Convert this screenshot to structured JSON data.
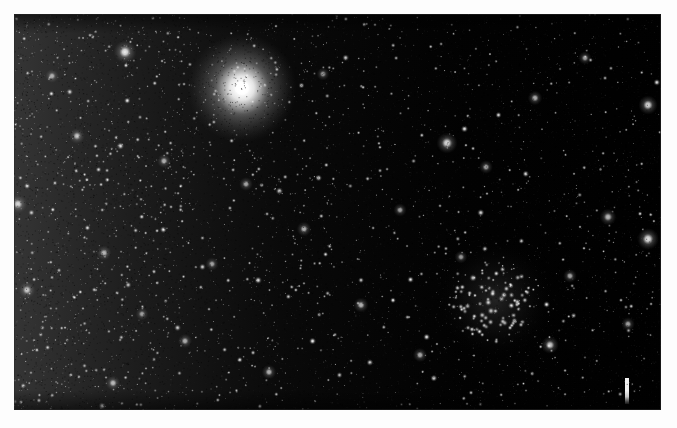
{
  "image": {
    "kind": "astronomical-photograph",
    "medium": "black-and-white photographic plate",
    "subject": "dense Milky Way star field containing a bright foreground star and an open star cluster",
    "alt_text": "Black and white astrophotograph of a dense star field; a very bright star lies in the upper left-of-center, a compact open star cluster lies in the lower right, and a short white vertical index mark is printed near the bottom right corner.",
    "width": 677,
    "height": 428,
    "border": {
      "color": "#fdfdfd",
      "left": 14,
      "top": 14,
      "right": 16,
      "bottom": 18
    },
    "plate": {
      "x": 14,
      "y": 14,
      "width": 647,
      "height": 396,
      "background_color": "#000000",
      "edge_color": "#282828"
    }
  },
  "chart_data": {
    "type": "scatter",
    "xlabel": "",
    "ylabel": "",
    "xlim": [
      0,
      647
    ],
    "ylim": [
      0,
      396
    ],
    "grid": false,
    "legend": "none",
    "background": "#000000",
    "point_color": "#ffffff",
    "density_regions": [
      {
        "name": "left-star-cloud",
        "x": 0,
        "y": 0,
        "width": 170,
        "height": 396,
        "relative_density": 1.0,
        "description": "richest Milky Way star cloud, left edge"
      },
      {
        "name": "left-center-field",
        "x": 170,
        "y": 0,
        "width": 150,
        "height": 396,
        "relative_density": 0.72,
        "description": "moderately rich field"
      },
      {
        "name": "center-field",
        "x": 320,
        "y": 0,
        "width": 160,
        "height": 396,
        "relative_density": 0.46,
        "description": "sparser mid field"
      },
      {
        "name": "right-field",
        "x": 480,
        "y": 0,
        "width": 167,
        "height": 396,
        "relative_density": 0.4,
        "description": "sparsest field, discrete stars"
      }
    ],
    "faint_star_count": 5200,
    "named_features": [
      {
        "name": "bright-foreground-star",
        "label": "Bright foreground star",
        "x": 228,
        "y": 74,
        "brightness": 1.0,
        "radius": 26,
        "core_radius": 7,
        "description": "dominant overexposed star with broad diffuse halo, upper left-of-center"
      },
      {
        "name": "open-star-cluster",
        "label": "Open star cluster",
        "x": 481,
        "y": 286,
        "brightness": 0.85,
        "radius": 48,
        "member_count": 95,
        "description": "compact concentration of resolved cluster members, lower right"
      },
      {
        "name": "index-tick-mark",
        "label": "Index tick mark",
        "x": 611,
        "y": 364,
        "width": 4,
        "height": 26,
        "color": "#f2f2f2",
        "description": "short white vertical fiducial mark printed near the bottom right corner"
      }
    ],
    "bright_stars": [
      {
        "x": 111,
        "y": 38,
        "brightness": 0.92,
        "radius": 5.5
      },
      {
        "x": 228,
        "y": 74,
        "brightness": 1.0,
        "radius": 26.0
      },
      {
        "x": 433,
        "y": 129,
        "brightness": 0.88,
        "radius": 5.0
      },
      {
        "x": 634,
        "y": 91,
        "brightness": 0.86,
        "radius": 4.6
      },
      {
        "x": 634,
        "y": 225,
        "brightness": 0.9,
        "radius": 5.2
      },
      {
        "x": 594,
        "y": 203,
        "brightness": 0.74,
        "radius": 4.0
      },
      {
        "x": 536,
        "y": 331,
        "brightness": 0.8,
        "radius": 4.2
      },
      {
        "x": 4,
        "y": 190,
        "brightness": 0.82,
        "radius": 4.4
      },
      {
        "x": 13,
        "y": 276,
        "brightness": 0.78,
        "radius": 4.0
      },
      {
        "x": 90,
        "y": 239,
        "brightness": 0.7,
        "radius": 3.6
      },
      {
        "x": 63,
        "y": 122,
        "brightness": 0.72,
        "radius": 3.8
      },
      {
        "x": 150,
        "y": 147,
        "brightness": 0.68,
        "radius": 3.4
      },
      {
        "x": 232,
        "y": 170,
        "brightness": 0.66,
        "radius": 3.3
      },
      {
        "x": 290,
        "y": 215,
        "brightness": 0.7,
        "radius": 3.5
      },
      {
        "x": 347,
        "y": 291,
        "brightness": 0.72,
        "radius": 3.6
      },
      {
        "x": 406,
        "y": 341,
        "brightness": 0.68,
        "radius": 3.4
      },
      {
        "x": 472,
        "y": 153,
        "brightness": 0.66,
        "radius": 3.3
      },
      {
        "x": 521,
        "y": 84,
        "brightness": 0.7,
        "radius": 3.5
      },
      {
        "x": 571,
        "y": 44,
        "brightness": 0.64,
        "radius": 3.2
      },
      {
        "x": 614,
        "y": 310,
        "brightness": 0.66,
        "radius": 3.3
      },
      {
        "x": 255,
        "y": 358,
        "brightness": 0.7,
        "radius": 3.5
      },
      {
        "x": 171,
        "y": 327,
        "brightness": 0.68,
        "radius": 3.4
      },
      {
        "x": 99,
        "y": 369,
        "brightness": 0.72,
        "radius": 3.6
      },
      {
        "x": 38,
        "y": 62,
        "brightness": 0.66,
        "radius": 3.3
      },
      {
        "x": 309,
        "y": 60,
        "brightness": 0.62,
        "radius": 3.1
      },
      {
        "x": 386,
        "y": 196,
        "brightness": 0.64,
        "radius": 3.2
      },
      {
        "x": 447,
        "y": 243,
        "brightness": 0.62,
        "radius": 3.1
      },
      {
        "x": 556,
        "y": 262,
        "brightness": 0.66,
        "radius": 3.3
      },
      {
        "x": 198,
        "y": 250,
        "brightness": 0.64,
        "radius": 3.2
      },
      {
        "x": 128,
        "y": 300,
        "brightness": 0.62,
        "radius": 3.1
      }
    ]
  }
}
